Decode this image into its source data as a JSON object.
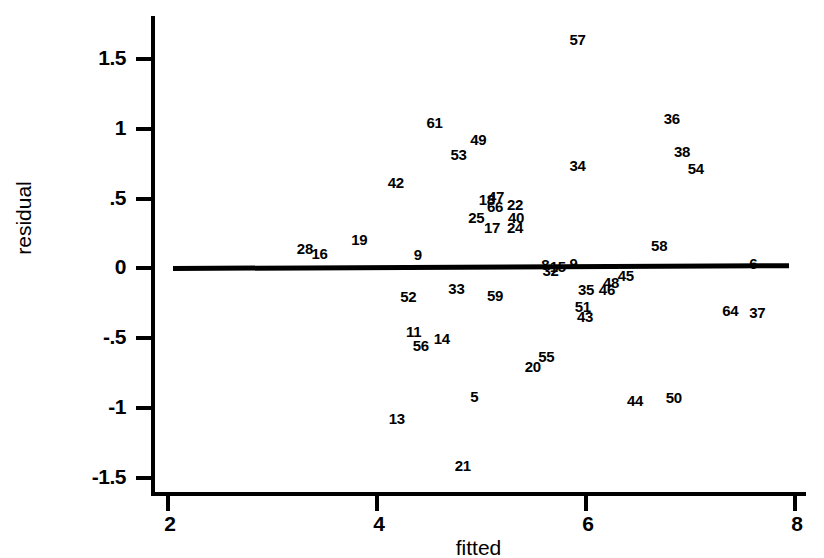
{
  "chart_data": {
    "type": "scatter",
    "title": "",
    "xlabel": "fitted",
    "ylabel": "residual",
    "xlim": [
      2,
      8
    ],
    "ylim": [
      -1.5,
      1.75
    ],
    "grid": false,
    "legend": "none",
    "xticks": [
      "2",
      "4",
      "6",
      "8"
    ],
    "xtick_values": [
      2,
      4,
      6,
      8
    ],
    "yticks": [
      "1.5",
      "1",
      ".5",
      "0",
      "-.5",
      "-1",
      "-1.5"
    ],
    "ytick_values": [
      1.5,
      1,
      0.5,
      0,
      -0.5,
      -1,
      -1.5
    ],
    "reference_line": {
      "label": "zero-residual-line",
      "x0": 2.05,
      "y0": 0.0,
      "x1": 7.94,
      "y1": 0.02
    },
    "point_label_note": "Each observation is drawn as its case-number text label rather than a marker glyph.",
    "points": [
      {
        "label": "57",
        "x": 5.92,
        "y": 1.64
      },
      {
        "label": "36",
        "x": 6.82,
        "y": 1.08
      },
      {
        "label": "61",
        "x": 4.55,
        "y": 1.05
      },
      {
        "label": "49",
        "x": 4.97,
        "y": 0.93
      },
      {
        "label": "38",
        "x": 6.92,
        "y": 0.84
      },
      {
        "label": "53",
        "x": 4.78,
        "y": 0.82
      },
      {
        "label": "34",
        "x": 5.92,
        "y": 0.74
      },
      {
        "label": "54",
        "x": 7.05,
        "y": 0.72
      },
      {
        "label": "42",
        "x": 4.18,
        "y": 0.62
      },
      {
        "label": "18",
        "x": 5.05,
        "y": 0.5
      },
      {
        "label": "47",
        "x": 5.14,
        "y": 0.52
      },
      {
        "label": "66",
        "x": 5.13,
        "y": 0.45
      },
      {
        "label": "22",
        "x": 5.32,
        "y": 0.46
      },
      {
        "label": "25",
        "x": 4.95,
        "y": 0.37
      },
      {
        "label": "40",
        "x": 5.33,
        "y": 0.37
      },
      {
        "label": "17",
        "x": 5.1,
        "y": 0.3
      },
      {
        "label": "24",
        "x": 5.32,
        "y": 0.3
      },
      {
        "label": "19",
        "x": 3.83,
        "y": 0.21
      },
      {
        "label": "28",
        "x": 3.31,
        "y": 0.15
      },
      {
        "label": "58",
        "x": 6.7,
        "y": 0.17
      },
      {
        "label": "16",
        "x": 3.45,
        "y": 0.11
      },
      {
        "label": "9",
        "x": 4.39,
        "y": 0.1
      },
      {
        "label": "8",
        "x": 5.61,
        "y": 0.03
      },
      {
        "label": "32",
        "x": 5.66,
        "y": -0.01
      },
      {
        "label": "15",
        "x": 5.73,
        "y": 0.02
      },
      {
        "label": "9b",
        "x": 5.88,
        "y": 0.04
      },
      {
        "label": "6",
        "x": 7.6,
        "y": 0.04
      },
      {
        "label": "45",
        "x": 6.38,
        "y": -0.05
      },
      {
        "label": "48",
        "x": 6.24,
        "y": -0.1
      },
      {
        "label": "46",
        "x": 6.2,
        "y": -0.15
      },
      {
        "label": "33",
        "x": 4.76,
        "y": -0.14
      },
      {
        "label": "35",
        "x": 6.0,
        "y": -0.15
      },
      {
        "label": "59",
        "x": 5.13,
        "y": -0.19
      },
      {
        "label": "52",
        "x": 4.3,
        "y": -0.2
      },
      {
        "label": "64",
        "x": 7.38,
        "y": -0.3
      },
      {
        "label": "37",
        "x": 7.64,
        "y": -0.31
      },
      {
        "label": "51",
        "x": 5.97,
        "y": -0.27
      },
      {
        "label": "43",
        "x": 5.99,
        "y": -0.34
      },
      {
        "label": "11",
        "x": 4.35,
        "y": -0.45
      },
      {
        "label": "14",
        "x": 4.62,
        "y": -0.5
      },
      {
        "label": "56",
        "x": 4.42,
        "y": -0.55
      },
      {
        "label": "55",
        "x": 5.62,
        "y": -0.63
      },
      {
        "label": "20",
        "x": 5.49,
        "y": -0.7
      },
      {
        "label": "5",
        "x": 4.93,
        "y": -0.91
      },
      {
        "label": "44",
        "x": 6.47,
        "y": -0.94
      },
      {
        "label": "50",
        "x": 6.84,
        "y": -0.92
      },
      {
        "label": "13",
        "x": 4.19,
        "y": -1.07
      },
      {
        "label": "21",
        "x": 4.82,
        "y": -1.41
      }
    ]
  },
  "caption": {
    "fragment": ""
  }
}
